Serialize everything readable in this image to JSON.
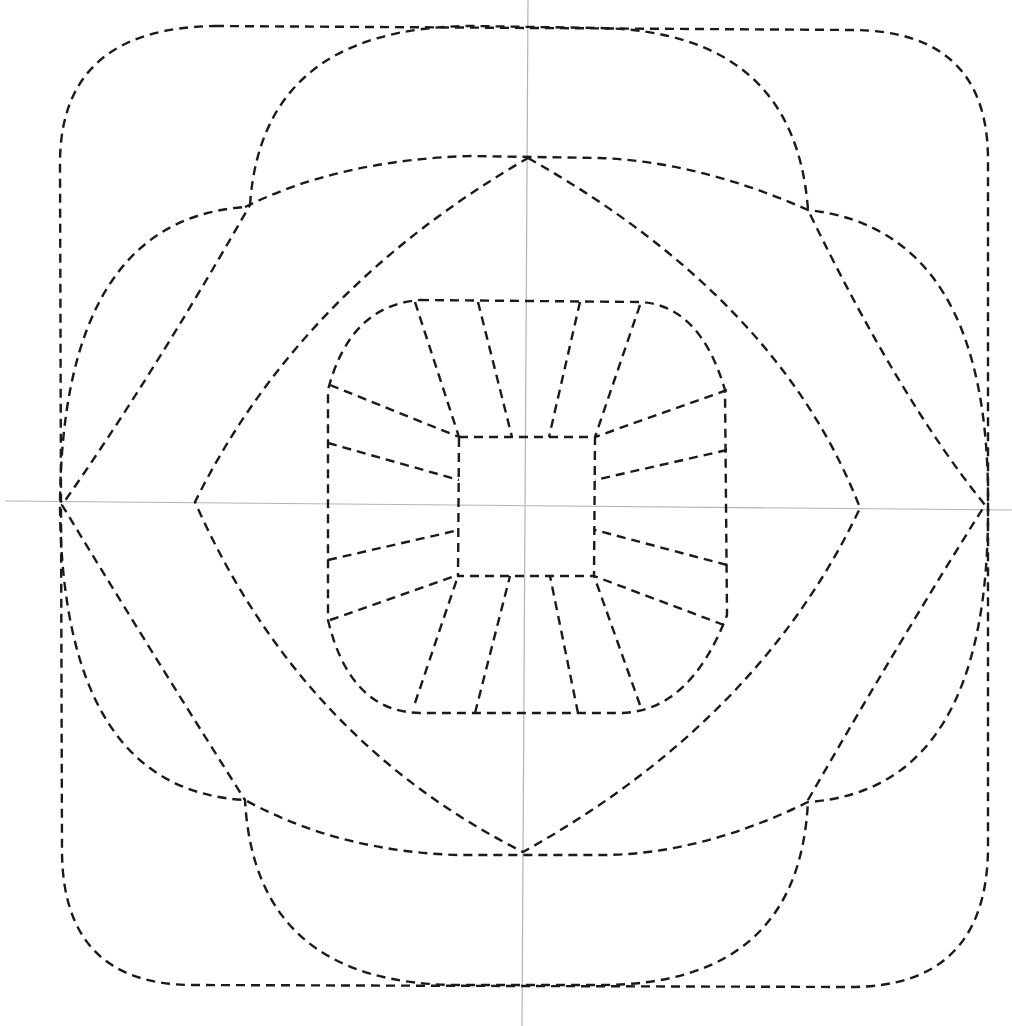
{
  "diagram": {
    "type": "geometric-construction",
    "canvas": {
      "width": 1012,
      "height": 1026,
      "background": "#ffffff"
    },
    "colors": {
      "line": "#1a1a1a",
      "axis": "#b4b4b4"
    },
    "line_style": "dashed",
    "axes": {
      "horizontal": {
        "x1": 5,
        "y1": 501,
        "x2": 1012,
        "y2": 510
      },
      "vertical": {
        "x1": 528,
        "y1": 0,
        "x2": 522,
        "y2": 1026
      }
    },
    "vertices": {
      "top": [
        528,
        158
      ],
      "right": [
        860,
        508
      ],
      "bottom": [
        523,
        852
      ],
      "left": [
        195,
        502
      ]
    },
    "shapes": [
      {
        "name": "outer-rounded-square",
        "d": "M 215 26 L 855 30 Q 988 32 988 160 L 988 850 Q 986 987 850 987 L 190 985 Q 62 983 62 850 L 60 160 Q 62 28 215 26 Z"
      },
      {
        "name": "vertical-capsule",
        "d": "M 250 205 Q 262 28 470 26 L 600 28 Q 795 32 808 210 Q 900 400 985 505 Q 900 640 808 800 Q 800 985 600 985 L 460 985 Q 255 985 245 800 Q 150 650 62 505 Q 150 380 250 205 Z"
      },
      {
        "name": "horizontal-capsule",
        "d": "M 245 207 Q 340 160 470 156 L 600 158 Q 700 162 808 210 Q 990 230 988 505 Q 990 790 808 802 Q 700 855 600 855 L 460 855 Q 340 852 245 800 Q 62 790 60 505 Q 62 220 245 207 Z"
      },
      {
        "name": "lens-star",
        "d": "M 528 158 Q 780 300 860 508 Q 760 720 523 852 Q 300 740 195 502 Q 300 290 528 158 Z"
      },
      {
        "name": "inner-rounded-square",
        "d": "M 420 300 L 640 302 Q 700 305 725 390 L 727 615 Q 690 712 620 713 L 420 713 Q 350 712 328 620 L 328 390 Q 350 305 420 300 Z"
      },
      {
        "name": "center-square",
        "d": "M 459 437 L 595 437 L 594 576 L 458 576 Z"
      }
    ],
    "spokes": [
      [
        415,
        302,
        459,
        437
      ],
      [
        478,
        302,
        512,
        437
      ],
      [
        580,
        302,
        549,
        437
      ],
      [
        640,
        305,
        595,
        437
      ],
      [
        330,
        385,
        459,
        437
      ],
      [
        328,
        443,
        459,
        480
      ],
      [
        328,
        560,
        459,
        530
      ],
      [
        330,
        620,
        458,
        575
      ],
      [
        727,
        390,
        595,
        437
      ],
      [
        727,
        450,
        595,
        480
      ],
      [
        727,
        565,
        595,
        530
      ],
      [
        724,
        625,
        594,
        576
      ],
      [
        415,
        703,
        458,
        576
      ],
      [
        475,
        713,
        510,
        576
      ],
      [
        578,
        713,
        550,
        576
      ],
      [
        640,
        705,
        594,
        576
      ]
    ]
  }
}
